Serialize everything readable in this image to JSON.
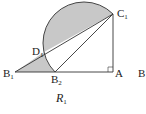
{
  "figure": {
    "caption": "R",
    "caption_sub": "1",
    "shade_color": "#c8c8c8",
    "line_color": "#333333",
    "points": {
      "B1": {
        "label": "B",
        "sub": "1"
      },
      "B2": {
        "label": "B",
        "sub": "2"
      },
      "A": {
        "label": "A",
        "sub": ""
      },
      "C1": {
        "label": "C",
        "sub": "1"
      },
      "D1": {
        "label": "D",
        "sub": "1"
      },
      "B": {
        "label": "B",
        "sub": ""
      }
    }
  }
}
